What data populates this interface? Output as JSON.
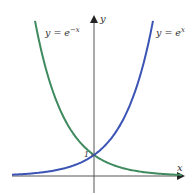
{
  "chart_data": {
    "type": "line",
    "title": "",
    "xlabel": "x",
    "ylabel": "y",
    "xlim": [
      -2.78,
      2.98
    ],
    "ylim": [
      -0.76,
      7.43
    ],
    "grid": false,
    "legend": "inline labels near curve tops",
    "annotations": [
      {
        "text": "1",
        "x": 0,
        "y": 1,
        "note": "y-intercept where both curves cross"
      }
    ],
    "series": [
      {
        "name": "y = e^{-x}",
        "label_text": "y = e",
        "label_exponent": "−x",
        "color": "#3f8a5e",
        "function": "exp(-x)",
        "x": [
          -2.0,
          -1.5,
          -1.0,
          -0.5,
          0.0,
          0.5,
          1.0,
          1.5,
          2.0,
          2.5,
          2.98
        ],
        "y": [
          7.39,
          4.48,
          2.72,
          1.65,
          1.0,
          0.61,
          0.37,
          0.22,
          0.14,
          0.08,
          0.05
        ]
      },
      {
        "name": "y = e^{x}",
        "label_text": "y = e",
        "label_exponent": "x",
        "color": "#3b54b5",
        "function": "exp(x)",
        "x": [
          -2.78,
          -2.5,
          -2.0,
          -1.5,
          -1.0,
          -0.5,
          0.0,
          0.5,
          1.0,
          1.5,
          2.0
        ],
        "y": [
          0.06,
          0.08,
          0.14,
          0.22,
          0.37,
          0.61,
          1.0,
          1.65,
          2.72,
          4.48,
          7.39
        ]
      }
    ]
  },
  "axes": {
    "x_label": "x",
    "y_label": "y",
    "intercept_label": "1",
    "axis_color": "#555555"
  }
}
